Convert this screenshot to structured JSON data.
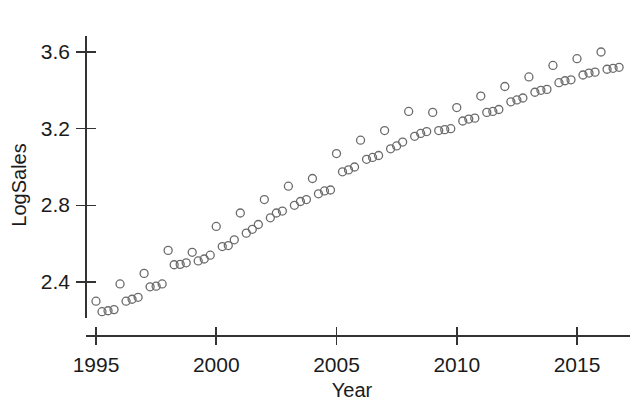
{
  "chart_data": {
    "type": "scatter",
    "title": "",
    "xlabel": "Year",
    "ylabel": "LogSales",
    "xlim": [
      1994.6,
      1996.0
    ],
    "ylim": [
      2.22,
      3.7
    ],
    "grid": false,
    "legend": "none",
    "marker": "open-circle",
    "marker_color": "#6b6b6b",
    "marker_size": 8,
    "xticks": [
      1995,
      2000,
      2005,
      2010,
      2015
    ],
    "xtick_labels": [
      "1995",
      "2000",
      "2005",
      "2010",
      "2015"
    ],
    "yticks": [
      2.4,
      2.8,
      3.2,
      3.6
    ],
    "ytick_labels": [
      "2.4",
      "2.8",
      "3.2",
      "3.6"
    ],
    "x_axis_range": [
      1994.6,
      2017.0
    ],
    "y_axis_range": [
      2.22,
      3.7
    ],
    "series": [
      {
        "name": "LogSales",
        "x": [
          1995.0,
          1995.25,
          1995.5,
          1995.75,
          1996.0,
          1996.25,
          1996.5,
          1996.75,
          1997.0,
          1997.25,
          1997.5,
          1997.75,
          1998.0,
          1998.25,
          1998.5,
          1998.75,
          1999.0,
          1999.25,
          1999.5,
          1999.75,
          2000.0,
          2000.25,
          2000.5,
          2000.75,
          2001.0,
          2001.25,
          2001.5,
          2001.75,
          2002.0,
          2002.25,
          2002.5,
          2002.75,
          2003.0,
          2003.25,
          2003.5,
          2003.75,
          2004.0,
          2004.25,
          2004.5,
          2004.75,
          2005.0,
          2005.25,
          2005.5,
          2005.75,
          2006.0,
          2006.25,
          2006.5,
          2006.75,
          2007.0,
          2007.25,
          2007.5,
          2007.75,
          2008.0,
          2008.25,
          2008.5,
          2008.75,
          2009.0,
          2009.25,
          2009.5,
          2009.75,
          2010.0,
          2010.25,
          2010.5,
          2010.75,
          2011.0,
          2011.25,
          2011.5,
          2011.75,
          2012.0,
          2012.25,
          2012.5,
          2012.75,
          2013.0,
          2013.25,
          2013.5,
          2013.75,
          2014.0,
          2014.25,
          2014.5,
          2014.75,
          2015.0,
          2015.25,
          2015.5,
          2015.75,
          2016.0,
          2016.25,
          2016.5,
          2016.75
        ],
        "y": [
          2.3,
          2.245,
          2.25,
          2.256,
          2.39,
          2.3,
          2.31,
          2.32,
          2.445,
          2.375,
          2.378,
          2.39,
          2.565,
          2.49,
          2.492,
          2.5,
          2.555,
          2.51,
          2.52,
          2.54,
          2.69,
          2.585,
          2.59,
          2.62,
          2.76,
          2.655,
          2.675,
          2.7,
          2.83,
          2.735,
          2.76,
          2.77,
          2.9,
          2.8,
          2.82,
          2.83,
          2.94,
          2.86,
          2.875,
          2.88,
          3.07,
          2.975,
          2.985,
          3.0,
          3.14,
          3.04,
          3.05,
          3.06,
          3.19,
          3.095,
          3.11,
          3.13,
          3.29,
          3.16,
          3.175,
          3.185,
          3.285,
          3.19,
          3.195,
          3.2,
          3.31,
          3.24,
          3.25,
          3.255,
          3.37,
          3.285,
          3.29,
          3.3,
          3.42,
          3.34,
          3.35,
          3.36,
          3.47,
          3.39,
          3.4,
          3.405,
          3.53,
          3.44,
          3.45,
          3.455,
          3.565,
          3.48,
          3.49,
          3.495,
          3.6,
          3.51,
          3.515,
          3.52
        ]
      }
    ]
  },
  "axes": {
    "y_label": "LogSales",
    "x_label": "Year",
    "y_tick_texts": [
      "3.6",
      "3.2",
      "2.8",
      "2.4"
    ],
    "x_tick_texts": [
      "1995",
      "2000",
      "2005",
      "2010",
      "2015"
    ]
  }
}
